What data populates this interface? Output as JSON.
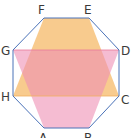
{
  "diagram": {
    "title": "",
    "octagon": {
      "vertices": [
        "A",
        "B",
        "C",
        "D",
        "E",
        "F",
        "G",
        "H"
      ],
      "stroke_color": "#4A72B8"
    },
    "shapes": [
      {
        "name": "trapezoid-FECH",
        "vertices": [
          "F",
          "E",
          "C",
          "H"
        ],
        "fill_color": "#F7C27A"
      },
      {
        "name": "trapezoid-GDBA",
        "vertices": [
          "G",
          "D",
          "B",
          "A"
        ],
        "fill_color": "#F0A3C4"
      }
    ],
    "labels": {
      "A": "A",
      "B": "B",
      "C": "C",
      "D": "D",
      "E": "E",
      "F": "F",
      "G": "G",
      "H": "H"
    }
  }
}
